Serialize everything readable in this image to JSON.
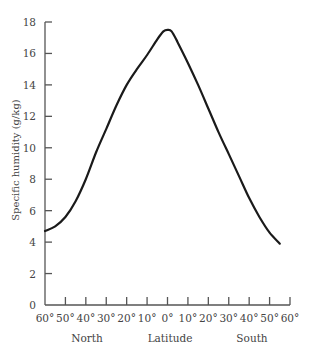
{
  "chart_data": {
    "type": "line",
    "title": "",
    "xlabel": "Latitude",
    "ylabel": "Specific humidity (g/kg)",
    "x_region_labels": [
      {
        "label": "North",
        "x": 35
      },
      {
        "label": "Latitude",
        "x": 0
      },
      {
        "label": "South",
        "x": -35
      }
    ],
    "x_tick_labels": [
      "60°",
      "50°",
      "40°",
      "30°",
      "20°",
      "10°",
      "0°",
      "10°",
      "20°",
      "30°",
      "40°",
      "50°",
      "60°"
    ],
    "x_ticks": [
      60,
      50,
      40,
      30,
      20,
      10,
      0,
      -10,
      -20,
      -30,
      -40,
      -50,
      -60
    ],
    "y_ticks": [
      0,
      2,
      4,
      6,
      8,
      10,
      12,
      14,
      16,
      18
    ],
    "y_tick_labels": [
      "0",
      "2",
      "4",
      "6",
      "8",
      "10",
      "12",
      "14",
      "16",
      "18"
    ],
    "xlim": [
      60,
      -60
    ],
    "ylim": [
      0,
      18
    ],
    "grid": false,
    "legend": null,
    "series": [
      {
        "name": "Specific humidity",
        "x": [
          60,
          55,
          50,
          45,
          40,
          35,
          30,
          25,
          20,
          15,
          10,
          5,
          2,
          0,
          -2,
          -5,
          -10,
          -15,
          -20,
          -25,
          -30,
          -35,
          -40,
          -45,
          -50,
          -55
        ],
        "values": [
          4.7,
          5.0,
          5.6,
          6.6,
          8.0,
          9.7,
          11.2,
          12.7,
          14.0,
          15.0,
          15.9,
          16.9,
          17.4,
          17.5,
          17.4,
          16.7,
          15.4,
          14.0,
          12.5,
          11.0,
          9.6,
          8.2,
          6.8,
          5.6,
          4.6,
          3.9
        ]
      }
    ]
  },
  "labels": {
    "ylabel": "Specific humidity (g/kg)",
    "north": "North",
    "latitude": "Latitude",
    "south": "South"
  }
}
